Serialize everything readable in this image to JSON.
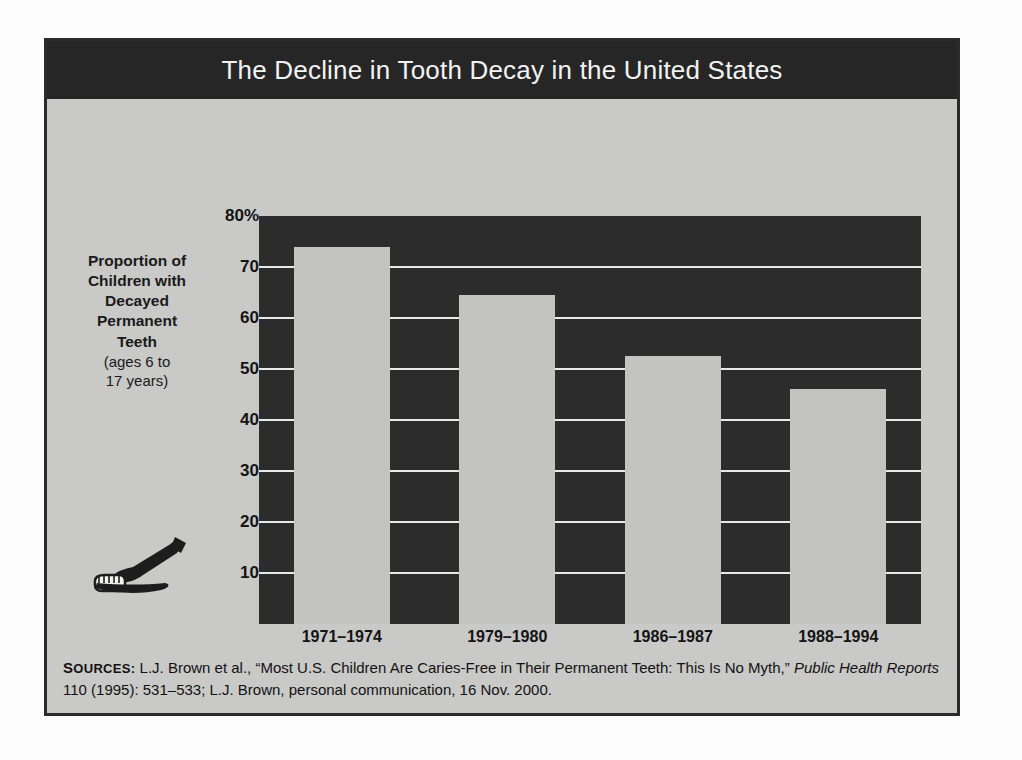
{
  "figure": {
    "title": "The Decline in Tooth Decay in the United States",
    "illustration_name": "toothpaste-and-toothbrush-illustration",
    "colors": {
      "frame_border": "#2b2b2b",
      "title_band": "#262626",
      "title_text": "#f2f2f2",
      "panel_background": "#c9c9c7",
      "plot_background": "#2c2c2c",
      "gridline": "#e9e9e9",
      "bar_fill": "#c3c3c1",
      "text": "#141414"
    }
  },
  "axis_label": {
    "line1": "Proportion of",
    "line2": "Children with",
    "line3": "Decayed",
    "line4": "Permanent",
    "line5": "Teeth",
    "line6": "(ages 6 to",
    "line7": "17 years)"
  },
  "sources": {
    "label": "Sources:",
    "label_caps": "S",
    "label_rest": "OURCES",
    "part1": " L.J. Brown et al., “Most U.S. Children Are Caries-Free in Their Permanent Teeth: This Is No Myth,” ",
    "italic": "Public Health Reports",
    "part2": " 110 (1995): 531–533; L.J. Brown, personal communication, 16 Nov. 2000."
  },
  "chart_data": {
    "type": "bar",
    "title": "The Decline in Tooth Decay in the United States",
    "xlabel": "",
    "ylabel": "Proportion of Children with Decayed Permanent Teeth (ages 6 to 17 years)",
    "categories": [
      "1971–1974",
      "1979–1980",
      "1986–1987",
      "1988–1994"
    ],
    "values": [
      74,
      64.5,
      52.5,
      46
    ],
    "ylim": [
      0,
      80
    ],
    "ytick_values": [
      80,
      70,
      60,
      50,
      40,
      30,
      20,
      10
    ],
    "ytick_labels": [
      "80%",
      "70",
      "60",
      "50",
      "40",
      "30",
      "20",
      "10"
    ],
    "grid": true,
    "legend": "none",
    "units": "percent"
  }
}
